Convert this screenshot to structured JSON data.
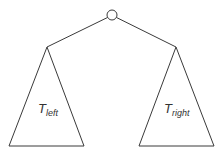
{
  "diagram": {
    "type": "binary-tree-schematic",
    "root": {
      "label": "",
      "cx": 112,
      "cy": 15,
      "r": 5
    },
    "subtrees": [
      {
        "id": "left",
        "label_base": "T",
        "label_sub": "left",
        "apex": [
          47,
          47
        ],
        "base_left": [
          9,
          146
        ],
        "base_right": [
          84,
          146
        ]
      },
      {
        "id": "right",
        "label_base": "T",
        "label_sub": "right",
        "apex": [
          176,
          47
        ],
        "base_left": [
          139,
          146
        ],
        "base_right": [
          214,
          146
        ]
      }
    ],
    "colors": {
      "stroke": "#3a3a3a",
      "background": "#ffffff",
      "text": "#333333"
    }
  }
}
